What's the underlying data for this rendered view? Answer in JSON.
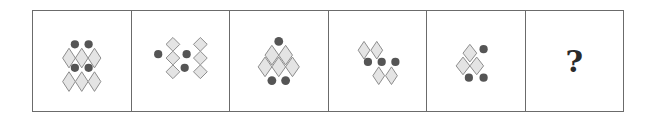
{
  "puzzle": {
    "type": "figure-sequence",
    "panel_count": 6,
    "colors": {
      "border": "#6b6b6b",
      "diamond_fill": "#e4e4e4",
      "diamond_stroke": "#8a8a8a",
      "dot": "#555555"
    },
    "panels": [
      {
        "index": 1,
        "description": "two dots above row of three diamonds, two dots above row of three diamonds",
        "diamond_count": 6,
        "dot_count": 4,
        "diamonds": [
          [
            -13,
            -3
          ],
          [
            0,
            -3
          ],
          [
            13,
            -3
          ],
          [
            -13,
            21
          ],
          [
            0,
            21
          ],
          [
            13,
            21
          ]
        ],
        "dots": [
          [
            -7,
            -16
          ],
          [
            7,
            -16
          ],
          [
            -7,
            8
          ],
          [
            7,
            8
          ]
        ]
      },
      {
        "index": 2,
        "description": "two columns of three diamonds in X arrangement with three dots",
        "diamond_count": 6,
        "dot_count": 3,
        "diamonds": [
          [
            -11,
            -14
          ],
          [
            -11,
            0
          ],
          [
            -11,
            14
          ],
          [
            11,
            -14
          ],
          [
            11,
            0
          ],
          [
            11,
            14
          ]
        ],
        "dots": [
          [
            -22,
            -7
          ],
          [
            0,
            -7
          ],
          [
            0,
            9
          ]
        ]
      },
      {
        "index": 3,
        "description": "triangle of three diamonds with one dot on top and two dots below",
        "diamond_count": 3,
        "dot_count": 3,
        "diamonds": [
          [
            -8,
            -6
          ],
          [
            8,
            -6
          ],
          [
            0,
            6
          ],
          [
            -15,
            6
          ],
          [
            15,
            6
          ]
        ],
        "dots": [
          [
            0,
            -20
          ],
          [
            -7,
            20
          ],
          [
            7,
            20
          ]
        ]
      },
      {
        "index": 4,
        "description": "two diamonds top, row of three dots, two diamonds bottom shifted right",
        "diamond_count": 4,
        "dot_count": 3,
        "diamonds": [
          [
            -14,
            -14
          ],
          [
            0,
            -14
          ],
          [
            0,
            16
          ],
          [
            14,
            16
          ]
        ],
        "dots": [
          [
            -12,
            2
          ],
          [
            2,
            2
          ],
          [
            16,
            2
          ]
        ]
      },
      {
        "index": 5,
        "description": "three diamonds in triangle with one dot at top-right and two dots below",
        "diamond_count": 3,
        "dot_count": 3,
        "diamonds": [
          [
            -8,
            -8
          ],
          [
            -16,
            2
          ],
          [
            0,
            2
          ]
        ],
        "dots": [
          [
            10,
            -10
          ],
          [
            -6,
            16
          ],
          [
            8,
            16
          ]
        ]
      },
      {
        "index": 6,
        "label": "?"
      }
    ]
  }
}
